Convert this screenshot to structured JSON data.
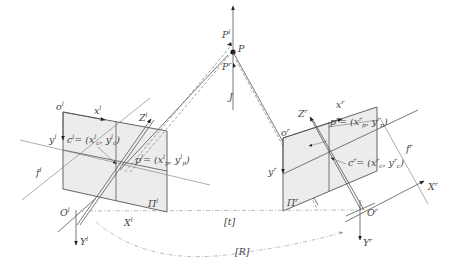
{
  "diagram": {
    "type": "stereo-camera-geometry",
    "world_point": {
      "label": "P",
      "left_projection": "P",
      "left_sup": "l",
      "right_projection": "P",
      "right_sup": "r",
      "vector": "J"
    },
    "left_camera": {
      "image_origin": "o",
      "image_origin_sup": "l",
      "x_axis": "x",
      "x_sup": "l",
      "y_axis": "y",
      "y_sup": "l",
      "principal_point": "c",
      "principal_point_sup": "l",
      "principal_point_eq": "= (x",
      "principal_point_coords": [
        "c",
        "l",
        "c",
        "l"
      ],
      "projected_point": "p",
      "projected_point_sup": "l",
      "projected_point_coords": [
        "p",
        "l",
        "p",
        "l"
      ],
      "focal": "f",
      "focal_sup": "l",
      "Z_axis": "Z",
      "Z_sup": "l",
      "X_axis": "X",
      "X_sup": "l",
      "Y_axis": "Y",
      "Y_sup": "l",
      "center": "O",
      "center_sup": "l",
      "plane": "Π",
      "plane_sup": "l"
    },
    "right_camera": {
      "image_origin": "o",
      "image_origin_sup": "r",
      "x_axis": "x",
      "x_sup": "r",
      "y_axis": "y",
      "y_sup": "r",
      "principal_point": "c",
      "principal_point_sup": "r",
      "projected_point": "p",
      "projected_point_sup": "r",
      "focal": "f",
      "focal_sup": "r",
      "Z_axis": "Z",
      "Z_sup": "r",
      "X_axis": "X",
      "X_sup": "r",
      "Y_axis": "Y",
      "Y_sup": "r",
      "center": "O",
      "center_sup": "r",
      "plane": "Π",
      "plane_sup": "r"
    },
    "extrinsics": {
      "translation": "[t]",
      "rotation": "[R]"
    },
    "text": {
      "cl_eq": "c",
      "cl_rest": "= (x",
      "pl_eq": "p",
      "cr_eq": "c",
      "pr_eq": "p",
      "comma": ", y",
      "close": ")"
    }
  }
}
